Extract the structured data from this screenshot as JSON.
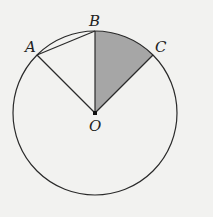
{
  "diagram": {
    "type": "circle-sector-geometry",
    "colors": {
      "background": "#f2f2f0",
      "stroke": "#2a2a2a",
      "sector_fill": "#a6a6a6"
    },
    "circle": {
      "cx": 95,
      "cy": 113,
      "r": 82
    },
    "points": {
      "A": {
        "label": "A",
        "x": 37,
        "y": 55
      },
      "B": {
        "label": "B",
        "x": 95,
        "y": 31
      },
      "C": {
        "label": "C",
        "x": 153,
        "y": 55
      },
      "O": {
        "label": "O",
        "x": 95,
        "y": 113
      }
    },
    "segments": [
      "OA",
      "OB",
      "OC",
      "AB"
    ],
    "shaded_sector": "BOC"
  }
}
